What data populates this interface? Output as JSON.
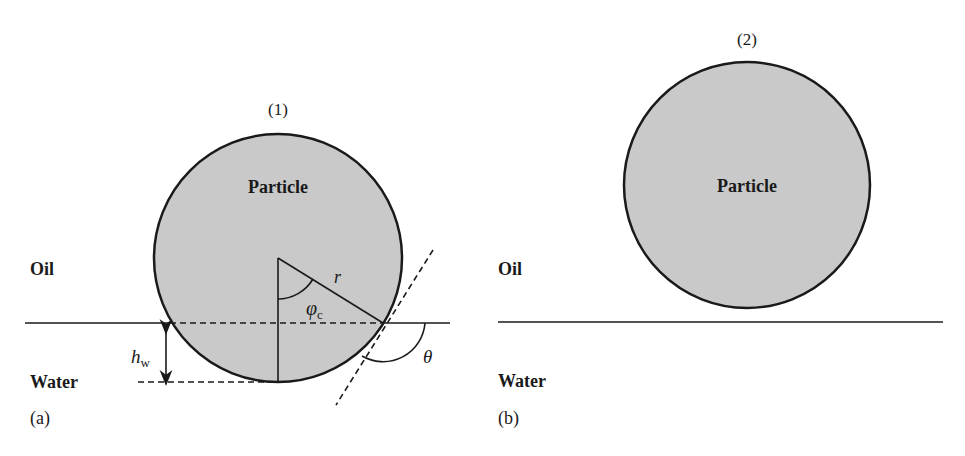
{
  "colors": {
    "particle_fill": "#c9c9c9",
    "stroke": "#1a1a1a",
    "background": "#ffffff"
  },
  "panel_a": {
    "panel_label": "(a)",
    "state_label": "(1)",
    "particle_label": "Particle",
    "oil_label": "Oil",
    "water_label": "Water",
    "radius_label": "r",
    "angle_phi_label": "φ",
    "angle_phi_subscript": "c",
    "contact_angle_label": "θ",
    "height_label": "h",
    "height_subscript": "w"
  },
  "panel_b": {
    "panel_label": "(b)",
    "state_label": "(2)",
    "particle_label": "Particle",
    "oil_label": "Oil",
    "water_label": "Water"
  }
}
